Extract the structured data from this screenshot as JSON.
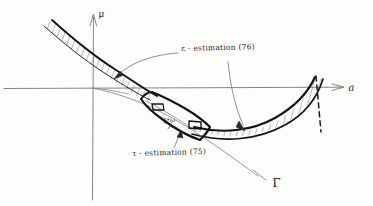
{
  "figure": {
    "kind": "hand-drawn-sketch",
    "background_color": "#fdfdfc",
    "ink_color": "#1d1d20",
    "light_ink_color": "#6b6b70",
    "width": 373,
    "height": 206
  },
  "axes": {
    "vertical_label": "μ",
    "horizontal_label": "a",
    "origin_x": 92,
    "origin_y": 88,
    "vertical_top_y": 16,
    "vertical_bottom_y": 200,
    "horizontal_left_x": 4,
    "horizontal_right_x": 345
  },
  "labels": {
    "epsilon_estimation": "ε - estimation (76)",
    "tau_estimation": "τ - estimation (75)",
    "curve_gamma": "Γ",
    "interior_point": "ξ*ω"
  },
  "annotations": [
    {
      "name": "epsilon-left-leader",
      "text": "ε - estimation (76)",
      "points_to": "left-hatched-band"
    },
    {
      "name": "epsilon-right-leader",
      "text": "ε - estimation (76)",
      "points_to": "right-hatched-band"
    },
    {
      "name": "tau-leader",
      "text": "τ - estimation (75)",
      "points_to": "central-parallelogram"
    }
  ],
  "regions": {
    "left_band": {
      "name": "left-hatched-band",
      "hatched": true,
      "hatch_angle_deg": 68
    },
    "right_band": {
      "name": "right-hatched-band",
      "hatched": true,
      "hatch_angle_deg": 72,
      "right_edge_style": "dashed"
    },
    "central_parallelogram": {
      "name": "central-parallelogram",
      "stroke_weight": "bold",
      "corner_boxes": 2
    }
  }
}
